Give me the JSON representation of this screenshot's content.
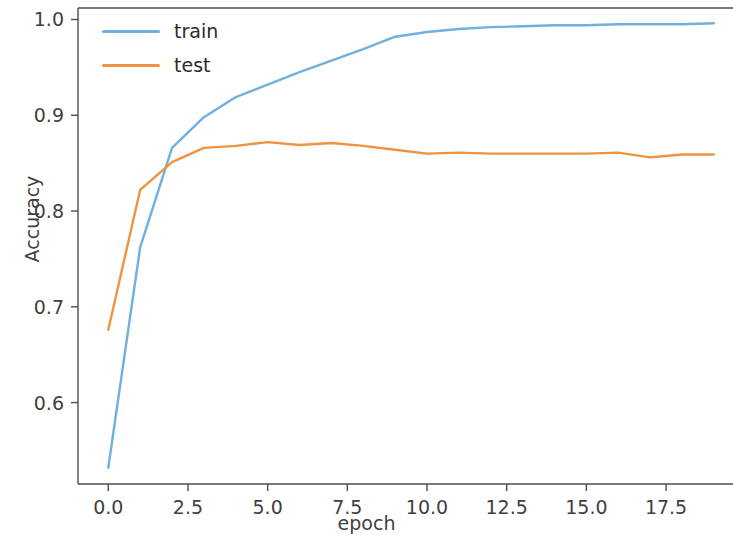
{
  "chart_data": {
    "type": "line",
    "title": "",
    "xlabel": "epoch",
    "ylabel": "Accuracy",
    "xlim": [
      -0.95,
      19.6
    ],
    "ylim": [
      0.515,
      1.012
    ],
    "grid": false,
    "legend_position": "upper left",
    "xticks": [
      "0.0",
      "2.5",
      "5.0",
      "7.5",
      "10.0",
      "12.5",
      "15.0",
      "17.5"
    ],
    "xtick_values": [
      0.0,
      2.5,
      5.0,
      7.5,
      10.0,
      12.5,
      15.0,
      17.5
    ],
    "yticks": [
      "0.6",
      "0.7",
      "0.8",
      "0.9",
      "1.0"
    ],
    "ytick_values": [
      0.6,
      0.7,
      0.8,
      0.9,
      1.0
    ],
    "x": [
      0,
      1,
      2,
      3,
      4,
      5,
      6,
      7,
      8,
      9,
      10,
      11,
      12,
      13,
      14,
      15,
      16,
      17,
      18,
      19
    ],
    "series": [
      {
        "name": "train",
        "color": "#6fb0e0",
        "values": [
          0.532,
          0.762,
          0.866,
          0.898,
          0.919,
          0.932,
          0.945,
          0.957,
          0.969,
          0.982,
          0.987,
          0.99,
          0.992,
          0.993,
          0.994,
          0.994,
          0.995,
          0.995,
          0.995,
          0.996
        ]
      },
      {
        "name": "test",
        "color": "#f0933f",
        "values": [
          0.676,
          0.822,
          0.851,
          0.866,
          0.868,
          0.872,
          0.869,
          0.871,
          0.868,
          0.864,
          0.86,
          0.861,
          0.86,
          0.86,
          0.86,
          0.86,
          0.861,
          0.856,
          0.859,
          0.859
        ]
      }
    ]
  },
  "axes": {
    "spine_color": "#4d4d4d",
    "tick_color": "#4d4d4d",
    "background": "#ffffff"
  },
  "legend": {
    "entries": [
      {
        "label": "train",
        "color": "#6fb0e0"
      },
      {
        "label": "test",
        "color": "#f0933f"
      }
    ]
  }
}
